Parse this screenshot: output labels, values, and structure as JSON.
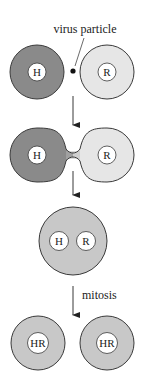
{
  "diagram": {
    "colors": {
      "background": "#ffffff",
      "stroke": "#3a3a3a",
      "h_cell_fill": "#8a8a8a",
      "r_cell_fill": "#e6e6e6",
      "fused_cell_fill": "#c8c8c8",
      "nucleus_fill": "#ffffff",
      "virus_fill": "#111111"
    },
    "labels": {
      "virus_particle": "virus particle",
      "mitosis": "mitosis"
    },
    "stages": [
      {
        "name": "separate-cells",
        "cells": [
          {
            "nucleus_label": "H",
            "fill": "h_cell_fill"
          },
          {
            "nucleus_label": "R",
            "fill": "r_cell_fill"
          }
        ]
      },
      {
        "name": "fusing-cells",
        "cells": [
          {
            "nucleus_label": "H",
            "fill": "h_cell_fill"
          },
          {
            "nucleus_label": "R",
            "fill": "r_cell_fill"
          }
        ]
      },
      {
        "name": "heterokaryon",
        "nuclei": [
          "H",
          "R"
        ]
      },
      {
        "name": "hybrid-daughter-cells",
        "cells": [
          {
            "nucleus_label": "HR"
          },
          {
            "nucleus_label": "HR"
          }
        ]
      }
    ]
  }
}
